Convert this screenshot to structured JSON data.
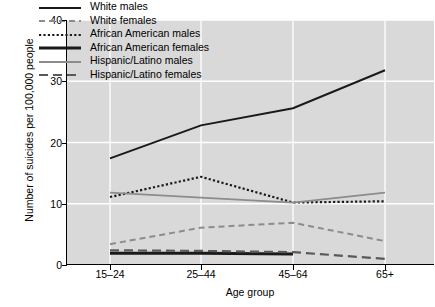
{
  "chart_data": {
    "type": "line",
    "title": "",
    "xlabel": "Age group",
    "ylabel": "Number of suicides per 100,000 people",
    "categories": [
      "15–24",
      "25–44",
      "45–64",
      "65+"
    ],
    "ytick_labels": [
      "0",
      "10",
      "20",
      "30",
      "40"
    ],
    "ylim": [
      0,
      40
    ],
    "yticks": [
      0,
      10,
      20,
      30,
      40
    ],
    "grid": true,
    "grid_color": "#ffffff",
    "plot_bg": "#d9d9d9",
    "legend_position": "upper left",
    "series": [
      {
        "name": "White males",
        "style": "solid",
        "color": "#1a1a1a",
        "width": 2.0,
        "values": [
          17.4,
          22.8,
          25.6,
          31.8
        ]
      },
      {
        "name": "White females",
        "style": "dashed",
        "color": "#8c8c8c",
        "width": 2.0,
        "values": [
          3.4,
          6.1,
          6.9,
          3.9
        ]
      },
      {
        "name": "African American males",
        "style": "dotted",
        "color": "#1a1a1a",
        "width": 2.2,
        "values": [
          11.1,
          14.4,
          10.2,
          10.4
        ]
      },
      {
        "name": "African American females",
        "style": "solid-thick",
        "color": "#1a1a1a",
        "width": 3.0,
        "values": [
          1.9,
          1.9,
          1.8,
          null
        ]
      },
      {
        "name": "Hispanic/Latino males",
        "style": "solid",
        "color": "#8c8c8c",
        "width": 1.8,
        "values": [
          11.8,
          11.0,
          10.2,
          11.8
        ]
      },
      {
        "name": "Hispanic/Latino females",
        "style": "long-dash",
        "color": "#595959",
        "width": 2.2,
        "values": [
          2.4,
          2.3,
          2.1,
          1.0
        ]
      }
    ]
  }
}
